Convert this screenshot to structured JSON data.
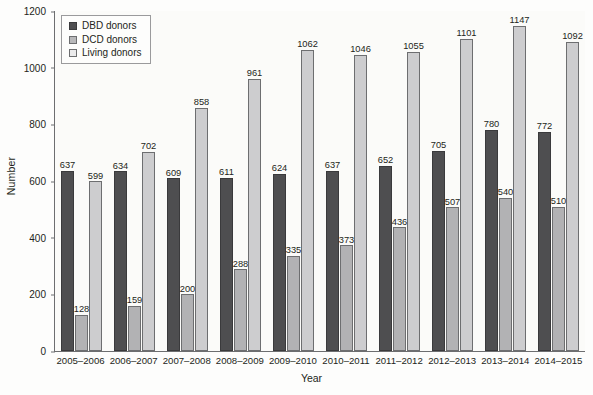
{
  "chart_data": {
    "type": "bar",
    "title": "",
    "xlabel": "Year",
    "ylabel": "Number",
    "ylim": [
      0,
      1200
    ],
    "yticks": [
      0,
      200,
      400,
      600,
      800,
      1000,
      1200
    ],
    "grid": false,
    "legend_position": "top-left",
    "categories": [
      "2005–2006",
      "2006–2007",
      "2007–2008",
      "2008–2009",
      "2009–2010",
      "2010–2011",
      "2011–2012",
      "2012–2013",
      "2013–2014",
      "2014–2015"
    ],
    "series": [
      {
        "name": "DBD donors",
        "color": "#4e4e50",
        "values": [
          637,
          634,
          609,
          611,
          624,
          637,
          652,
          705,
          780,
          772
        ]
      },
      {
        "name": "DCD donors",
        "color": "#b2b2b4",
        "values": [
          128,
          159,
          200,
          288,
          335,
          373,
          436,
          507,
          540,
          510
        ]
      },
      {
        "name": "Living donors",
        "color": "#cdcdcf",
        "values": [
          599,
          702,
          858,
          961,
          1062,
          1046,
          1055,
          1101,
          1147,
          1092
        ]
      }
    ]
  }
}
